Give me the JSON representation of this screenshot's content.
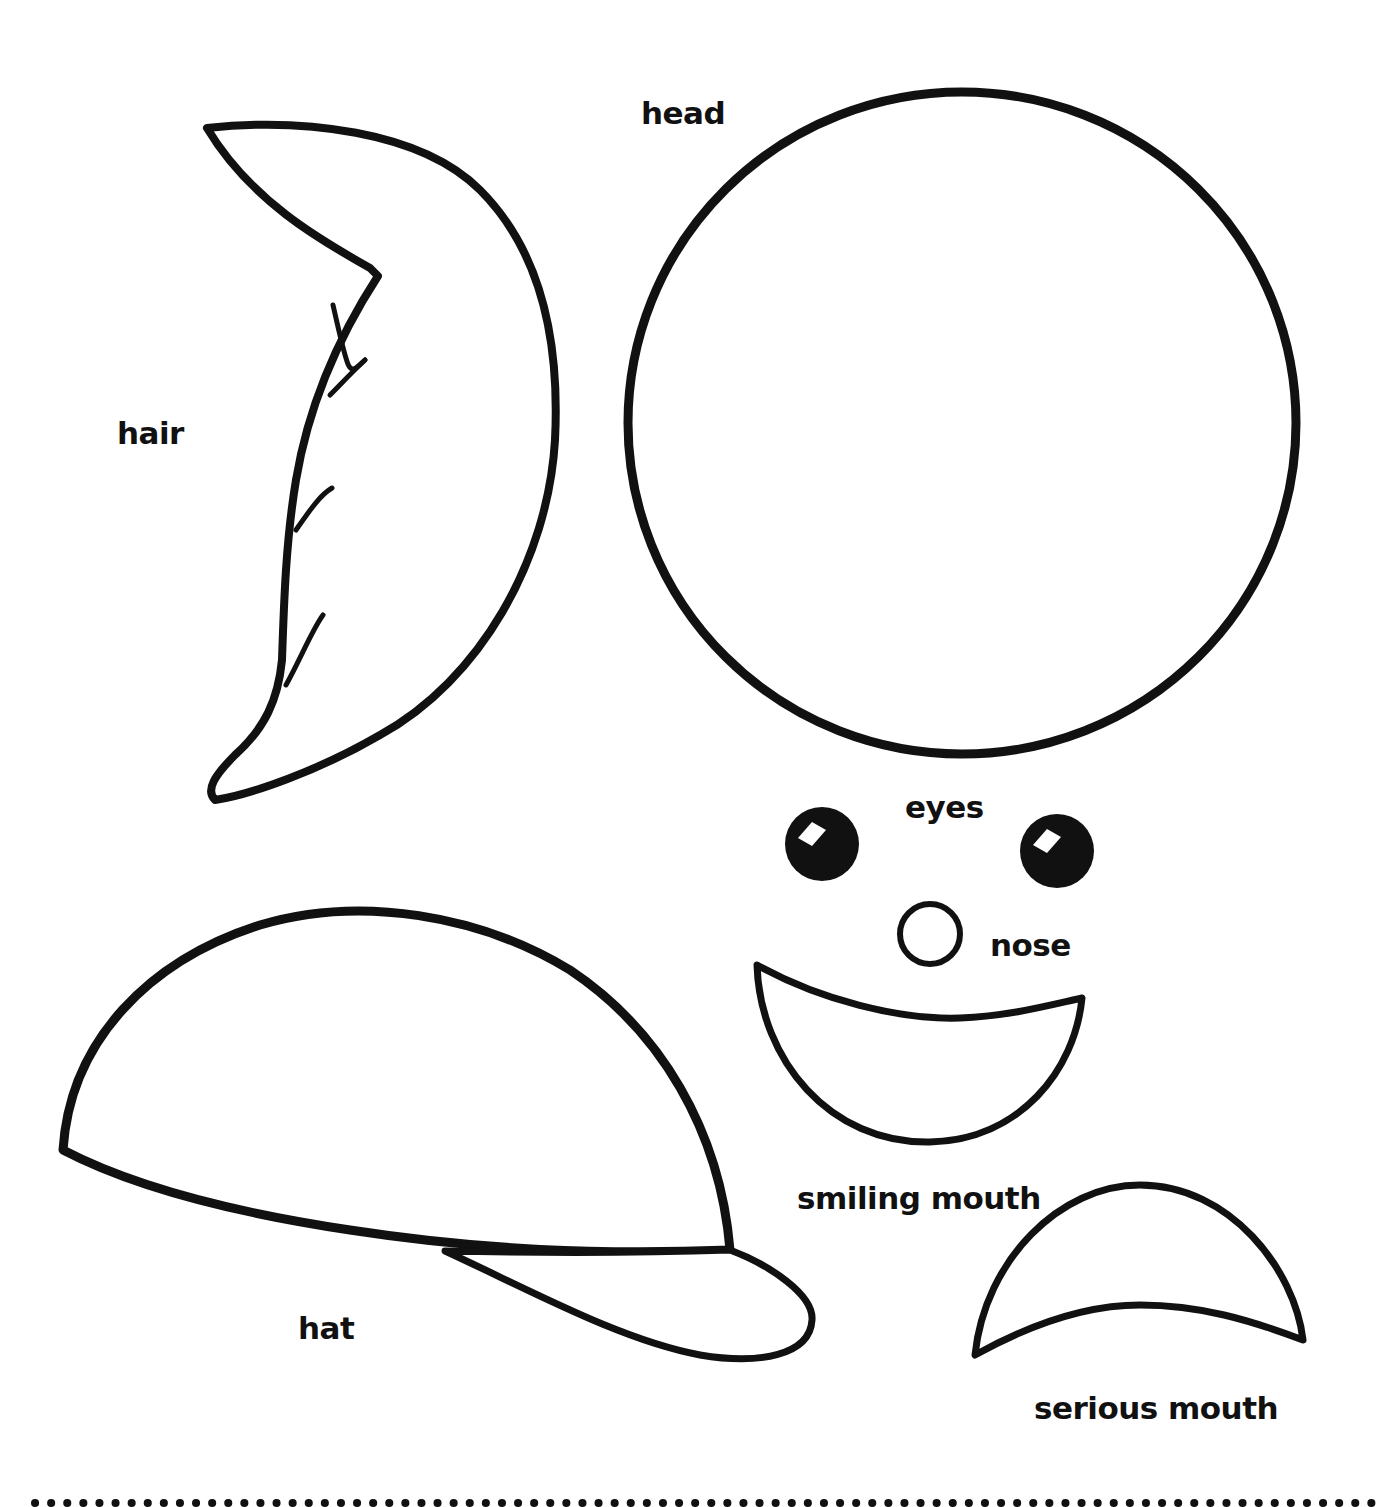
{
  "sheet": {
    "background": "#ffffff",
    "ink_color": "#111111"
  },
  "pieces": [
    {
      "id": "head",
      "label": "head"
    },
    {
      "id": "hair",
      "label": "hair"
    },
    {
      "id": "eyes",
      "label": "eyes"
    },
    {
      "id": "nose",
      "label": "nose"
    },
    {
      "id": "hat",
      "label": "hat"
    },
    {
      "id": "smiling-mouth",
      "label": "smiling mouth"
    },
    {
      "id": "serious-mouth",
      "label": "serious mouth"
    }
  ],
  "labels": {
    "head": "head",
    "hair": "hair",
    "eyes": "eyes",
    "nose": "nose",
    "hat": "hat",
    "smiling_mouth": "smiling mouth",
    "serious_mouth": "serious mouth"
  },
  "cut_line": {
    "style": "dotted",
    "dot_spacing_px": 16
  }
}
